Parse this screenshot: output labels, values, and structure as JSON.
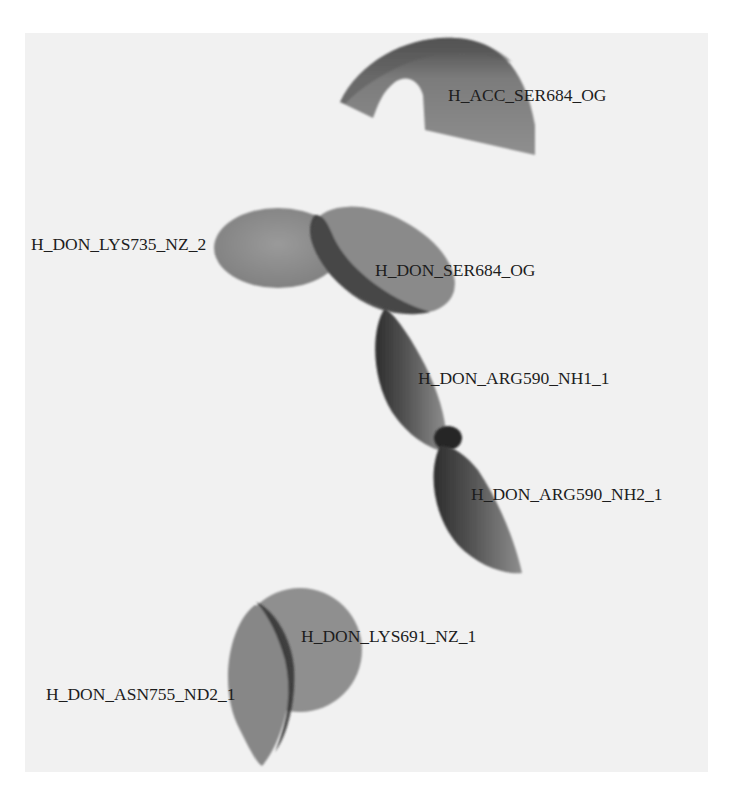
{
  "figure": {
    "type": "pharmacophore-hydrogen-bond-features",
    "background_color": "#f1f1f1",
    "feature_color": "#8c8c8c",
    "features": [
      {
        "id": "f1",
        "label": "H_ACC_SER684_OG",
        "kind": "acceptor",
        "shape": "half-dome"
      },
      {
        "id": "f2",
        "label": "H_DON_LYS735_NZ_2",
        "kind": "donor",
        "shape": "disc"
      },
      {
        "id": "f3",
        "label": "H_DON_SER684_OG",
        "kind": "donor",
        "shape": "disc"
      },
      {
        "id": "f4",
        "label": "H_DON_ARG590_NH1_1",
        "kind": "donor",
        "shape": "disc"
      },
      {
        "id": "f5",
        "label": "H_DON_ARG590_NH2_1",
        "kind": "donor",
        "shape": "disc"
      },
      {
        "id": "f6",
        "label": "H_DON_LYS691_NZ_1",
        "kind": "donor",
        "shape": "disc"
      },
      {
        "id": "f7",
        "label": "H_DON_ASN755_ND2_1",
        "kind": "donor",
        "shape": "disc"
      }
    ]
  }
}
